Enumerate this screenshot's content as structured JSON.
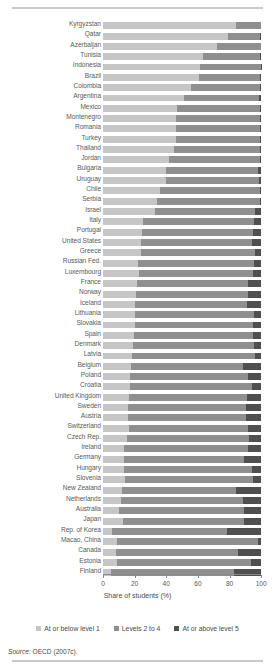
{
  "axis": {
    "xlabel": "Share of students (%)",
    "ticks": [
      "0",
      "20",
      "40",
      "60",
      "80",
      "100"
    ]
  },
  "legend": {
    "items": [
      {
        "label": "At or below level 1",
        "color": "#c6c6c6"
      },
      {
        "label": "Levels 2 to 4",
        "color": "#8f8f8f"
      },
      {
        "label": "At or above level 5",
        "color": "#4f4f4f"
      }
    ]
  },
  "source": {
    "prefix": "Source:",
    "text": "OECD (2007c)."
  },
  "chart_data": {
    "type": "bar",
    "orientation": "horizontal",
    "stacked": true,
    "title": "",
    "xlabel": "Share of students (%)",
    "ylabel": "",
    "xlim": [
      0,
      100
    ],
    "grid": false,
    "legend_position": "bottom",
    "series": [
      {
        "name": "At or below level 1",
        "color": "#c6c6c6"
      },
      {
        "name": "Levels 2 to 4",
        "color": "#8f8f8f"
      },
      {
        "name": "At or above level 5",
        "color": "#4f4f4f"
      }
    ],
    "categories": [
      "Kyrgyzstan",
      "Qatar",
      "Azerbaijan",
      "Tunisia",
      "Indonesia",
      "Brazil",
      "Colombia",
      "Argentina",
      "Mexico",
      "Montenegro",
      "Romania",
      "Turkey",
      "Thailand",
      "Jordan",
      "Bulgaria",
      "Uruguay",
      "Chile",
      "Serbia",
      "Israel",
      "Italy",
      "Portugal",
      "United States",
      "Greece",
      "Russian Fed.",
      "Luxembourg",
      "France",
      "Norway",
      "Iceland",
      "Lithuania",
      "Slovakia",
      "Spain",
      "Denmark",
      "Latvia",
      "Belgium",
      "Poland",
      "Croatia",
      "United Kingdom",
      "Sweden",
      "Austria",
      "Switzerland",
      "Czech Rep.",
      "Ireland",
      "Germany",
      "Hungary",
      "Slovenia",
      "New Zealand",
      "Netherlands",
      "Australia",
      "Japan",
      "Rep. of Korea",
      "Macao, China",
      "Canada",
      "Estonia",
      "Finland"
    ],
    "values": [
      [
        84.0,
        16.0,
        0.0
      ],
      [
        79.0,
        20.6,
        0.4
      ],
      [
        72.0,
        28.0,
        0.0
      ],
      [
        63.0,
        36.6,
        0.4
      ],
      [
        61.5,
        38.3,
        0.2
      ],
      [
        61.0,
        38.4,
        0.6
      ],
      [
        56.0,
        43.5,
        0.5
      ],
      [
        51.0,
        48.0,
        1.0
      ],
      [
        47.0,
        52.5,
        0.5
      ],
      [
        46.5,
        53.0,
        0.5
      ],
      [
        46.0,
        53.5,
        0.5
      ],
      [
        46.5,
        52.7,
        0.8
      ],
      [
        45.0,
        54.6,
        0.4
      ],
      [
        42.0,
        57.5,
        0.5
      ],
      [
        40.0,
        58.4,
        1.6
      ],
      [
        40.0,
        58.8,
        1.2
      ],
      [
        36.0,
        63.5,
        0.5
      ],
      [
        34.0,
        65.6,
        0.4
      ],
      [
        33.0,
        63.0,
        4.0
      ],
      [
        25.5,
        70.0,
        4.5
      ],
      [
        24.5,
        70.5,
        5.0
      ],
      [
        24.0,
        70.0,
        6.0
      ],
      [
        24.0,
        72.3,
        3.7
      ],
      [
        22.0,
        73.5,
        4.5
      ],
      [
        22.5,
        72.5,
        5.0
      ],
      [
        21.5,
        70.5,
        8.0
      ],
      [
        21.0,
        70.5,
        8.5
      ],
      [
        20.5,
        70.5,
        9.0
      ],
      [
        20.0,
        75.5,
        4.5
      ],
      [
        20.0,
        75.2,
        4.8
      ],
      [
        19.5,
        75.6,
        4.9
      ],
      [
        19.0,
        76.8,
        4.2
      ],
      [
        18.5,
        77.5,
        4.0
      ],
      [
        18.0,
        70.8,
        11.2
      ],
      [
        17.0,
        75.0,
        8.0
      ],
      [
        17.0,
        77.5,
        5.5
      ],
      [
        16.5,
        74.5,
        9.0
      ],
      [
        16.0,
        74.7,
        9.3
      ],
      [
        16.0,
        74.8,
        9.2
      ],
      [
        16.5,
        75.2,
        8.3
      ],
      [
        15.5,
        77.0,
        7.5
      ],
      [
        13.0,
        79.0,
        8.0
      ],
      [
        13.5,
        76.0,
        10.5
      ],
      [
        13.0,
        81.0,
        6.0
      ],
      [
        14.0,
        81.0,
        5.0
      ],
      [
        12.0,
        72.0,
        16.0
      ],
      [
        11.5,
        76.9,
        11.6
      ],
      [
        10.0,
        79.2,
        10.8
      ],
      [
        12.5,
        77.0,
        10.5
      ],
      [
        5.5,
        72.7,
        21.8
      ],
      [
        9.0,
        89.2,
        1.8
      ],
      [
        8.5,
        76.9,
        14.6
      ],
      [
        9.0,
        84.8,
        6.2
      ],
      [
        5.0,
        78.2,
        16.8
      ]
    ]
  }
}
